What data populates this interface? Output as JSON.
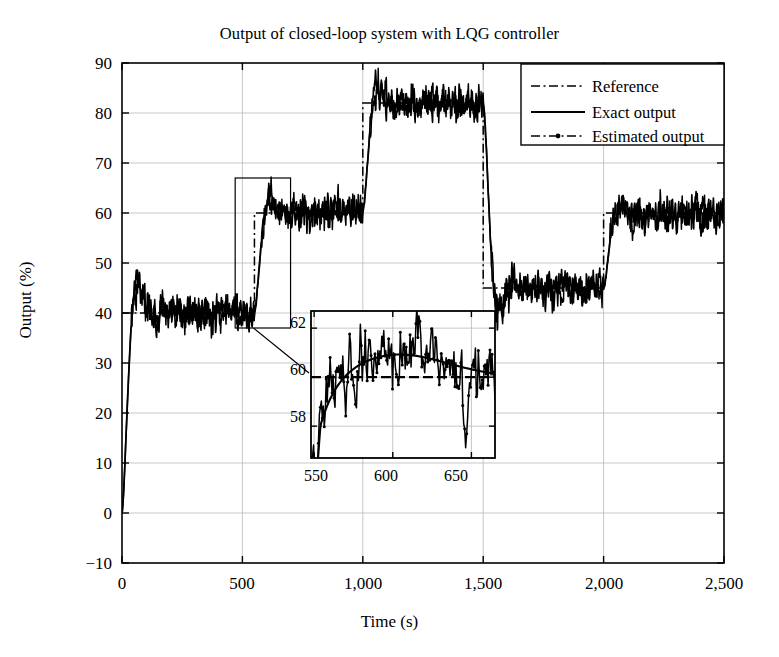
{
  "chart_data": {
    "type": "line",
    "title": "Output of closed-loop system with LQG controller",
    "xlabel": "Time (s)",
    "ylabel": "Output (%)",
    "xlim": [
      0,
      2500
    ],
    "ylim": [
      -10,
      90
    ],
    "xticks": [
      0,
      500,
      1000,
      1500,
      2000,
      2500
    ],
    "xticklabels": [
      "0",
      "500",
      "1,000",
      "1,500",
      "2,000",
      "2,500"
    ],
    "yticks": [
      -10,
      0,
      10,
      20,
      30,
      40,
      50,
      60,
      70,
      80,
      90
    ],
    "yticklabels": [
      "−10",
      "0",
      "10",
      "20",
      "30",
      "40",
      "50",
      "60",
      "70",
      "80",
      "90"
    ],
    "grid": true,
    "legend_position": "upper right",
    "legend": [
      "Reference",
      "Exact output",
      "Estimated output"
    ],
    "series": [
      {
        "name": "Reference",
        "style": "dash-dot",
        "description": "Setpoint staircase",
        "x": [
          0,
          0,
          550,
          550,
          1000,
          1000,
          1500,
          1500,
          2000,
          2000,
          2500
        ],
        "y": [
          40,
          40,
          40,
          60,
          60,
          82,
          82,
          45,
          45,
          60,
          60
        ]
      },
      {
        "name": "Exact output",
        "style": "solid",
        "description": "Noisy measured plant output tracking the reference staircase",
        "setpoints": [
          {
            "t_start": 0,
            "t_end": 550,
            "level": 40,
            "overshoot_peak": 45,
            "peak_time": 80
          },
          {
            "t_start": 550,
            "t_end": 1000,
            "level": 60
          },
          {
            "t_start": 1000,
            "t_end": 1500,
            "level": 82
          },
          {
            "t_start": 1500,
            "t_end": 2000,
            "level": 45
          },
          {
            "t_start": 2000,
            "t_end": 2500,
            "level": 60
          }
        ],
        "noise_amplitude": 1.4
      },
      {
        "name": "Estimated output",
        "style": "dash-dot-marker",
        "description": "Kalman-filter estimate, overlapping the exact output at main scale"
      }
    ],
    "inset": {
      "xlim": [
        548,
        665
      ],
      "ylim": [
        56.7,
        62.7
      ],
      "xticks": [
        550,
        600,
        650
      ],
      "xticklabels": [
        "550",
        "600",
        "650"
      ],
      "yticks": [
        58,
        60,
        62
      ],
      "yticklabels": [
        "58",
        "60",
        "62"
      ],
      "grid": true,
      "reference_level": 60,
      "description": "Magnification of the 550-665 s step response showing reference at 60, smooth exact output and noisy estimated output"
    },
    "zoom_rect": {
      "x_range": [
        470,
        700
      ],
      "y_range": [
        37,
        67
      ],
      "description": "Rectangle on main axes marking the region shown in the inset"
    }
  }
}
